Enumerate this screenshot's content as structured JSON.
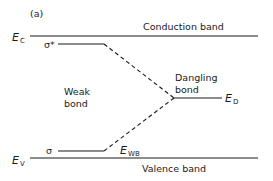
{
  "panel_label": "(a)",
  "levels": {
    "conduction": {
      "symbol": "E",
      "subscript": "C",
      "label": "Conduction band"
    },
    "valence": {
      "symbol": "E",
      "subscript": "V",
      "label": "Valence band"
    },
    "sigma_star": {
      "label": "σ*"
    },
    "sigma": {
      "label": "σ"
    },
    "dangling": {
      "symbol": "E",
      "subscript": "D",
      "label_line1": "Dangling",
      "label_line2": "bond"
    },
    "weak_bond": {
      "symbol": "E",
      "subscript": "WB",
      "label_line1": "Weak",
      "label_line2": "bond"
    }
  },
  "colors": {
    "line": "#1a1a1a",
    "background": "#ffffff"
  }
}
